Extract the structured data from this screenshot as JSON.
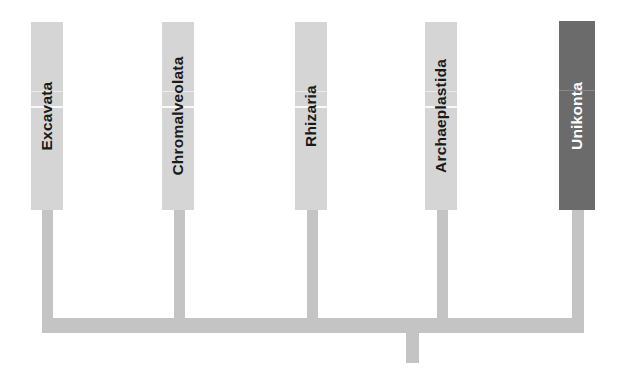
{
  "diagram": {
    "type": "phylogenetic-tree",
    "colors": {
      "box": "#d5d5d5",
      "highlight_box": "#6b6b6b",
      "branch": "#c4c4c4",
      "label": "#1a1a1a",
      "highlight_label": "#ffffff",
      "background": "#ffffff"
    },
    "taxa": [
      {
        "label": "Excavata",
        "highlighted": false
      },
      {
        "label": "Chromalveolata",
        "highlighted": false
      },
      {
        "label": "Rhizaria",
        "highlighted": false
      },
      {
        "label": "Archaeplastida",
        "highlighted": false
      },
      {
        "label": "Unikonta",
        "highlighted": true
      }
    ]
  }
}
